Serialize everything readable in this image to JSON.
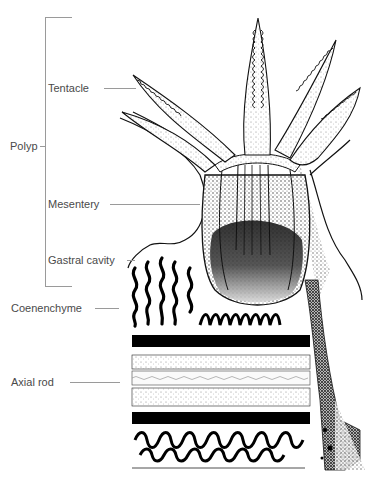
{
  "figure": {
    "bracket_label": "Polyp",
    "labels": [
      {
        "id": "tentacle",
        "text": "Tentacle"
      },
      {
        "id": "mesentery",
        "text": "Mesentery"
      },
      {
        "id": "gastral-cavity",
        "text": "Gastral cavity"
      },
      {
        "id": "coenenchyme",
        "text": "Coenenchyme"
      },
      {
        "id": "axial-rod",
        "text": "Axial rod"
      }
    ]
  },
  "colors": {
    "ink": "#111111",
    "leader_line": "#9a9a9a",
    "label_text": "#4a4a4a",
    "background": "#ffffff"
  }
}
